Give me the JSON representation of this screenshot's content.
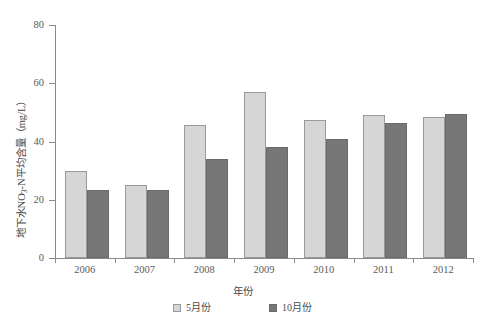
{
  "chart_data": {
    "type": "bar",
    "title": "",
    "subtitle": "",
    "xlabel": "年份",
    "ylabel": "地下水NO3-N平均含量（mg/L）",
    "ylabel_parts": {
      "prefix": "地下水NO",
      "subscript": "3",
      "suffix": "-N平均含量（mg/L）"
    },
    "categories": [
      "2006",
      "2007",
      "2008",
      "2009",
      "2010",
      "2011",
      "2012"
    ],
    "series": [
      {
        "name": "5月份",
        "color": "#d6d6d6",
        "values": [
          30,
          25,
          45.5,
          57,
          47.5,
          49,
          48.5
        ]
      },
      {
        "name": "10月份",
        "color": "#777777",
        "values": [
          23.5,
          23.5,
          34,
          38,
          41,
          46.5,
          49.5
        ]
      }
    ],
    "ylim": [
      0,
      80
    ],
    "yticks": [
      0,
      20,
      40,
      60,
      80
    ],
    "ytick_labels": [
      "0",
      "20",
      "40",
      "60",
      "80"
    ],
    "grid": false,
    "legend_position": "bottom",
    "legend_entries": [
      "5月份",
      "10月份"
    ],
    "units": "mg/L"
  }
}
